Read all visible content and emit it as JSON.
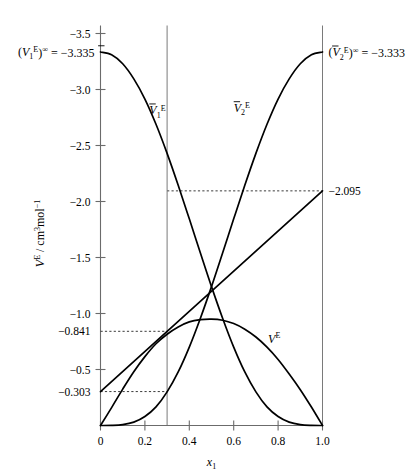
{
  "chart_data": {
    "type": "line",
    "title": "",
    "xlabel": "x_1",
    "ylabel": "V^E / cm^3 mol^-1",
    "xlabel_parts": {
      "base": "x",
      "sub": "1"
    },
    "ylabel_parts": {
      "v": "V",
      "v_sup": "E",
      "slash": " / cm",
      "cm_sup": "3",
      "mol": "mol",
      "mol_sup": "−1"
    },
    "xlim": [
      0.0,
      1.0
    ],
    "ylim": [
      -3.5,
      0.0
    ],
    "y_axis_inverted": true,
    "grid": false,
    "legend": "none",
    "xticks": [
      0.0,
      0.2,
      0.4,
      0.6,
      0.8,
      1.0
    ],
    "xticklabels": [
      "0",
      "0.2",
      "0.4",
      "0.6",
      "0.8",
      "1.0"
    ],
    "yticks": [
      -3.5,
      -3.0,
      -2.5,
      -2.0,
      -1.5,
      -1.0,
      -0.5
    ],
    "yticklabels": [
      "−3.5",
      "−3.0",
      "−2.5",
      "−2.0",
      "−1.5",
      "−1.0",
      "−0.5"
    ],
    "y_special_ticks": [
      {
        "value": -0.841,
        "label": "−0.841"
      },
      {
        "value": -0.303,
        "label": "−0.303"
      }
    ],
    "reference_vlines": [
      {
        "x": 0.3,
        "label": ""
      },
      {
        "x": 1.0,
        "label": ""
      }
    ],
    "dashed_guides": [
      {
        "y": -2.095,
        "x_from": 0.3,
        "x_to": 1.0,
        "label": "−2.095"
      },
      {
        "y": -0.841,
        "x_from": 0.0,
        "x_to": 0.3,
        "label": "−0.841"
      },
      {
        "y": -0.303,
        "x_from": 0.0,
        "x_to": 0.3,
        "label": "−0.303"
      }
    ],
    "series": [
      {
        "name": "V1bar_E",
        "label": "V̅1E",
        "label_parts": {
          "base": "V",
          "sub": "1",
          "sup": "E"
        },
        "label_x": 0.22,
        "label_y": -2.78,
        "x": [
          0.0,
          0.05,
          0.1,
          0.15,
          0.2,
          0.25,
          0.3,
          0.35,
          0.4,
          0.45,
          0.5,
          0.55,
          0.6,
          0.65,
          0.7,
          0.75,
          0.8,
          0.85,
          0.9,
          0.95,
          1.0
        ],
        "values": [
          -3.335,
          -3.31,
          -3.23,
          -3.095,
          -2.915,
          -2.69,
          -2.43,
          -2.145,
          -1.845,
          -1.54,
          -1.24,
          -0.958,
          -0.7,
          -0.478,
          -0.3,
          -0.166,
          -0.08,
          -0.03,
          -0.008,
          -0.001,
          0.0
        ]
      },
      {
        "name": "V2bar_E",
        "label": "V̅2E",
        "label_parts": {
          "base": "V",
          "sub": "2",
          "sup": "E"
        },
        "label_x": 0.6,
        "label_y": -2.8,
        "x": [
          0.0,
          0.05,
          0.1,
          0.15,
          0.2,
          0.25,
          0.3,
          0.35,
          0.4,
          0.45,
          0.5,
          0.55,
          0.6,
          0.65,
          0.7,
          0.75,
          0.8,
          0.85,
          0.9,
          0.95,
          1.0
        ],
        "values": [
          0.0,
          -0.001,
          -0.008,
          -0.03,
          -0.08,
          -0.166,
          -0.3,
          -0.478,
          -0.7,
          -0.958,
          -1.24,
          -1.54,
          -1.845,
          -2.145,
          -2.43,
          -2.69,
          -2.915,
          -3.095,
          -3.23,
          -3.31,
          -3.335
        ]
      },
      {
        "name": "V_E",
        "label": "VE",
        "label_parts": {
          "base": "V",
          "sub": "",
          "sup": "E"
        },
        "label_x": 0.755,
        "label_y": -0.74,
        "x": [
          0.0,
          0.05,
          0.1,
          0.15,
          0.2,
          0.25,
          0.3,
          0.35,
          0.4,
          0.45,
          0.5,
          0.55,
          0.6,
          0.65,
          0.7,
          0.75,
          0.8,
          0.85,
          0.9,
          0.95,
          1.0
        ],
        "values": [
          0.0,
          -0.16,
          -0.325,
          -0.48,
          -0.615,
          -0.73,
          -0.815,
          -0.88,
          -0.925,
          -0.945,
          -0.95,
          -0.94,
          -0.91,
          -0.86,
          -0.79,
          -0.7,
          -0.59,
          -0.46,
          -0.32,
          -0.165,
          0.0
        ]
      }
    ],
    "tangent_line": {
      "name": "tangent-at-x-0.3",
      "from": {
        "x": 0.0,
        "y": -0.303
      },
      "to": {
        "x": 1.0,
        "y": -2.095
      },
      "touch_point": {
        "x": 0.3,
        "y": -0.841
      }
    },
    "annotations": [
      {
        "name": "v1-infinite-dilution",
        "text": "(V̅1E)∞ = −3.335",
        "parts": {
          "open": "(",
          "base": "V",
          "sub": "1",
          "sup": "E",
          "close": ")",
          "inf": "∞",
          "eq": " = −3.335"
        },
        "value": -3.335,
        "x": 0.0,
        "y": -3.335,
        "anchor": "end"
      },
      {
        "name": "v2-infinite-dilution",
        "text": "(V̅2E)∞ = −3.333",
        "parts": {
          "open": "(",
          "base": "V",
          "sub": "2",
          "sup": "E",
          "close": ")",
          "inf": "∞",
          "eq": " = −3.333"
        },
        "value": -3.333,
        "x": 1.0,
        "y": -3.333,
        "anchor": "start"
      },
      {
        "name": "tangent-intercept-right",
        "text": "−2.095",
        "value": -2.095,
        "x": 1.0,
        "y": -2.095,
        "anchor": "start"
      }
    ]
  }
}
